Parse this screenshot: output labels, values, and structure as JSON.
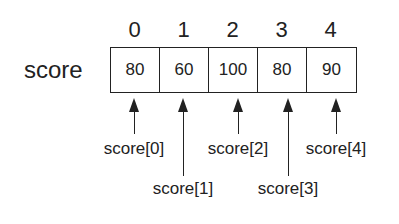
{
  "diagram": {
    "variable_name": "score",
    "indices": [
      "0",
      "1",
      "2",
      "3",
      "4"
    ],
    "values": [
      "80",
      "60",
      "100",
      "80",
      "90"
    ],
    "labels": [
      "score[0]",
      "score[1]",
      "score[2]",
      "score[3]",
      "score[4]"
    ]
  }
}
